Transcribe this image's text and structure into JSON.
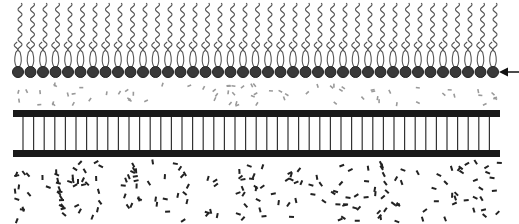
{
  "diagram": {
    "type": "lipid-monolayer-on-substrate",
    "components": [
      {
        "name": "lipid-monolayer",
        "description": "Row of lipid molecules with dark circular heads and two wavy tails pointing upward"
      },
      {
        "name": "upper-particle-layer",
        "description": "Light grey scattered dash particles below heads"
      },
      {
        "name": "scaffold",
        "description": "Two thick horizontal bars joined by vertical rungs"
      },
      {
        "name": "lower-particle-layer",
        "description": "Dense dark scattered dash particles"
      },
      {
        "name": "arrow",
        "description": "Arrow on right pointing left at lipid head row"
      }
    ],
    "lipid_count": 39,
    "lipid_start_x": 18,
    "lipid_spacing": 12.5,
    "head_y": 72,
    "head_radius": 5.5,
    "rung_count": 46,
    "rung_start_x": 23,
    "rung_spacing": 10.6,
    "bar_left": 13,
    "bar_right": 500,
    "top_bar_y": 110,
    "bottom_bar_y": 150,
    "bar_height": 7,
    "colors": {
      "head": "#3a3a3a",
      "head_stroke": "#222222",
      "tail": "#555555",
      "bar": "#1a1a1a",
      "rung": "#333333",
      "upper_particles": "#9a9a9a",
      "lower_particles": "#222222",
      "arrow": "#111111"
    }
  }
}
